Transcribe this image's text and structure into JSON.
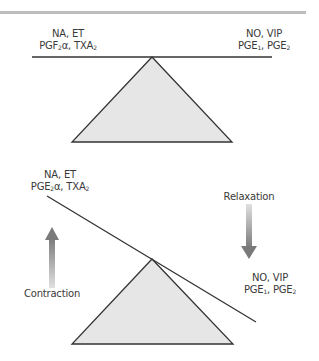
{
  "header": {
    "bar_color": "#bdbdbd"
  },
  "balanced": {
    "left_label": {
      "line1": "NA, ET",
      "line2_prefix": "PGF",
      "line2_sub1": "2",
      "line2_mid": "α, TXA",
      "line2_sub2": "2"
    },
    "right_label": {
      "line1": "NO, VIP",
      "line2_prefix": "PGE",
      "line2_sub1": "1",
      "line2_mid": ", PGE",
      "line2_sub2": "2"
    }
  },
  "tilted": {
    "left_label": {
      "line1": "NA, ET",
      "line2_prefix": "PGE",
      "line2_sub1": "2",
      "line2_mid": "α, TXA",
      "line2_sub2": "2"
    },
    "right_label": {
      "line1": "NO, VIP",
      "line2_prefix": "PGE",
      "line2_sub1": "1",
      "line2_mid": ", PGE",
      "line2_sub2": "2"
    },
    "contraction_label": "Contraction",
    "relaxation_label": "Relaxation"
  },
  "colors": {
    "triangle_fill": "#e6e6e6",
    "line": "#333333",
    "arrow": "#8a8a8a"
  }
}
